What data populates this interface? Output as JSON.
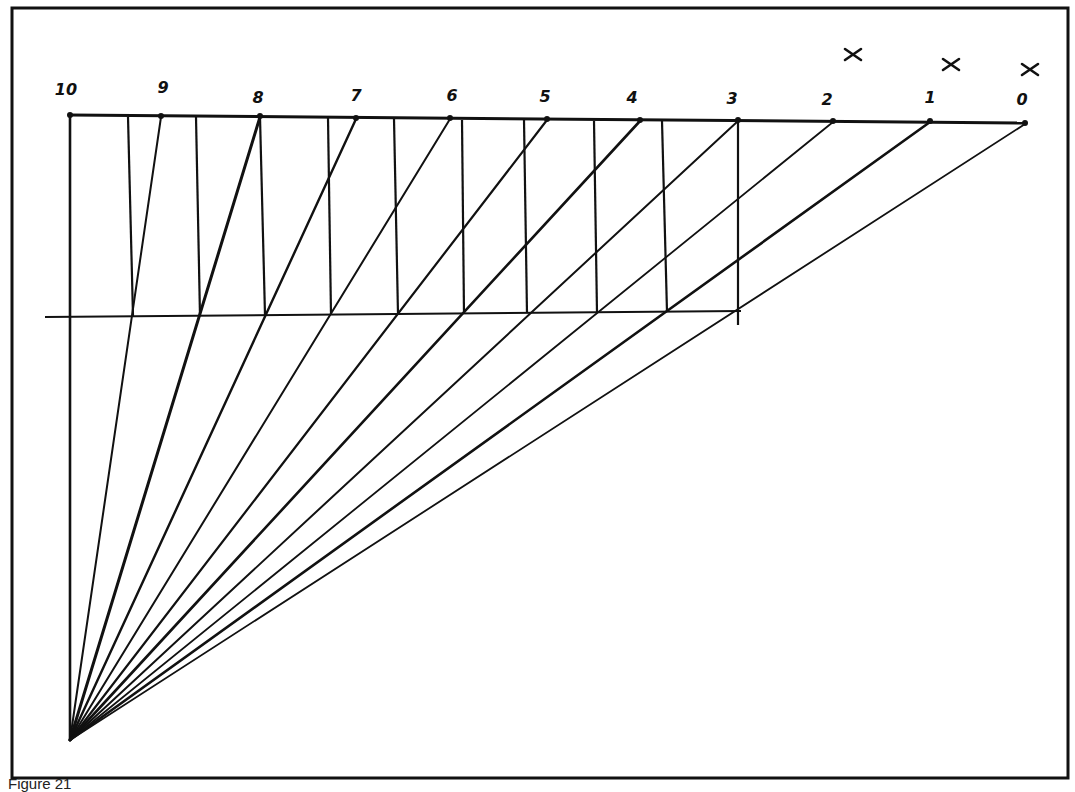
{
  "figure": {
    "caption": "Figure 21",
    "colors": {
      "ink": "#111111",
      "paper": "#ffffff"
    },
    "frame": {
      "x1": 12,
      "y1": 8,
      "x2": 1068,
      "y2": 778
    },
    "apex": {
      "x": 70,
      "y": 740
    },
    "top_line": {
      "x1": 70,
      "y1": 115,
      "x2": 1026,
      "y2": 123
    },
    "scale_labels": [
      "10",
      "9",
      "8",
      "7",
      "6",
      "5",
      "4",
      "3",
      "2",
      "1",
      "0"
    ],
    "scale_ticks": [
      {
        "label": "10",
        "x": 70,
        "y": 116,
        "lx": 66,
        "ly": 95
      },
      {
        "label": "9",
        "x": 161,
        "y": 117,
        "lx": 163,
        "ly": 93
      },
      {
        "label": "8",
        "x": 260,
        "y": 117,
        "lx": 258,
        "ly": 103
      },
      {
        "label": "7",
        "x": 356,
        "y": 119,
        "lx": 356,
        "ly": 101
      },
      {
        "label": "6",
        "x": 450,
        "y": 119,
        "lx": 452,
        "ly": 101
      },
      {
        "label": "5",
        "x": 547,
        "y": 120,
        "lx": 545,
        "ly": 102
      },
      {
        "label": "4",
        "x": 640,
        "y": 121,
        "lx": 632,
        "ly": 103
      },
      {
        "label": "3",
        "x": 738,
        "y": 121,
        "lx": 732,
        "ly": 104
      },
      {
        "label": "2",
        "x": 833,
        "y": 122,
        "lx": 827,
        "ly": 105
      },
      {
        "label": "1",
        "x": 930,
        "y": 122,
        "lx": 930,
        "ly": 103
      },
      {
        "label": "0",
        "x": 1025,
        "y": 124,
        "lx": 1022,
        "ly": 105
      }
    ],
    "x_marks": [
      {
        "label": "x",
        "x": 853,
        "y": 55
      },
      {
        "label": "x",
        "x": 951,
        "y": 65
      },
      {
        "label": "x",
        "x": 1030,
        "y": 70
      }
    ],
    "second_line": {
      "x1": 45,
      "y1": 317,
      "x2": 741,
      "y2": 311
    },
    "verticals": [
      {
        "x1": 128,
        "y1": 117,
        "x2": 133,
        "y2": 316
      },
      {
        "x1": 196,
        "y1": 117,
        "x2": 200,
        "y2": 316
      },
      {
        "x1": 260,
        "y1": 117,
        "x2": 265,
        "y2": 315
      },
      {
        "x1": 328,
        "y1": 118,
        "x2": 331,
        "y2": 315
      },
      {
        "x1": 394,
        "y1": 119,
        "x2": 398,
        "y2": 314
      },
      {
        "x1": 462,
        "y1": 120,
        "x2": 464,
        "y2": 314
      },
      {
        "x1": 524,
        "y1": 120,
        "x2": 527,
        "y2": 313
      },
      {
        "x1": 594,
        "y1": 121,
        "x2": 597,
        "y2": 313
      },
      {
        "x1": 662,
        "y1": 121,
        "x2": 667,
        "y2": 312
      },
      {
        "x1": 738,
        "y1": 121,
        "x2": 738,
        "y2": 325
      }
    ],
    "rays": [
      {
        "to": "10",
        "x": 70,
        "y": 116,
        "w": 2.6
      },
      {
        "to": "9",
        "x": 161,
        "y": 117,
        "w": 2.0
      },
      {
        "to": "8",
        "x": 260,
        "y": 117,
        "w": 3.0
      },
      {
        "to": "7",
        "x": 356,
        "y": 119,
        "w": 2.4
      },
      {
        "to": "6",
        "x": 450,
        "y": 119,
        "w": 2.0
      },
      {
        "to": "5",
        "x": 547,
        "y": 120,
        "w": 2.2
      },
      {
        "to": "4",
        "x": 640,
        "y": 121,
        "w": 2.6
      },
      {
        "to": "3",
        "x": 738,
        "y": 121,
        "w": 2.0
      },
      {
        "to": "2",
        "x": 833,
        "y": 122,
        "w": 1.8
      },
      {
        "to": "1",
        "x": 930,
        "y": 122,
        "w": 2.6
      },
      {
        "to": "0",
        "x": 1025,
        "y": 124,
        "w": 1.8
      }
    ]
  }
}
